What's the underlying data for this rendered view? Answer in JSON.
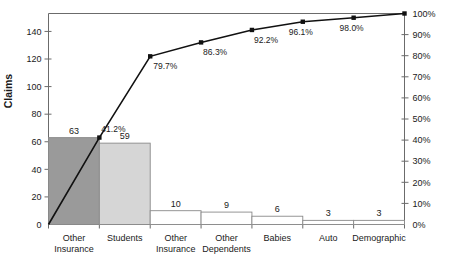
{
  "chart_data": {
    "type": "bar",
    "title": "",
    "subtitle": "",
    "xlabel": "",
    "ylabel": "Claims",
    "y2label": "",
    "ylim": [
      0,
      153
    ],
    "y2lim": [
      0,
      100
    ],
    "grid": false,
    "legend": "none",
    "categories": [
      "Other Insurance",
      "Students",
      "Other Insurance",
      "Other Dependents",
      "Babies",
      "Auto",
      "Demographic"
    ],
    "category_lines": [
      [
        "Other",
        "Insurance"
      ],
      [
        "Students",
        ""
      ],
      [
        "Other",
        "Insurance"
      ],
      [
        "Other",
        "Dependents"
      ],
      [
        "Babies",
        ""
      ],
      [
        "Auto",
        ""
      ],
      [
        "Demographic",
        ""
      ]
    ],
    "values": [
      63,
      59,
      10,
      9,
      6,
      3,
      3
    ],
    "value_labels": [
      "63",
      "59",
      "10",
      "9",
      "6",
      "3",
      "3"
    ],
    "bar_colors": [
      "#9a9a9a",
      "#d6d6d6",
      "#ffffff",
      "#ffffff",
      "#ffffff",
      "#ffffff",
      "#ffffff"
    ],
    "cumulative_percent": [
      41.2,
      79.7,
      86.3,
      92.2,
      96.1,
      98.0,
      100.0
    ],
    "cumulative_labels": [
      "41.2%",
      "79.7%",
      "86.3%",
      "92.2%",
      "96.1%",
      "98.0%",
      "100%"
    ],
    "y_ticks": [
      0,
      20,
      40,
      60,
      80,
      100,
      120,
      140
    ],
    "y_tick_labels": [
      "0",
      "20",
      "40",
      "60",
      "80",
      "100",
      "120",
      "140"
    ],
    "y2_ticks": [
      0,
      10,
      20,
      30,
      40,
      50,
      60,
      70,
      80,
      90,
      100
    ],
    "y2_tick_labels": [
      "0%",
      "10%",
      "20%",
      "30%",
      "40%",
      "50%",
      "60%",
      "70%",
      "80%",
      "90%",
      "100%"
    ],
    "total_claims": 153,
    "line_color": "#111111",
    "axis_color": "#6b6b6b"
  }
}
